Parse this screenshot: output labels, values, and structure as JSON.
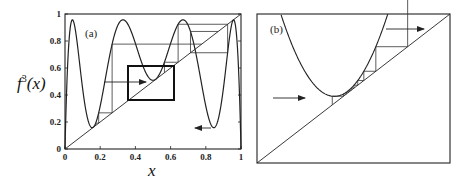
{
  "chart_data": [
    {
      "type": "line",
      "panel_label": "(a)",
      "xlabel": "x",
      "ylabel": "f^3(x)",
      "xlim": [
        0,
        1
      ],
      "ylim": [
        0,
        1
      ],
      "xticks": [
        "0",
        "0.2",
        "0.4",
        "0.6",
        "0.8",
        "1"
      ],
      "yticks": [
        "0",
        "0.2",
        "0.4",
        "0.6",
        "0.8",
        "1"
      ],
      "series": [
        {
          "name": "f^3(x) logistic map, r≈3.83",
          "description": "third iterate of logistic map with four humps, minima near 0.16 and 0.52 and 0.16"
        },
        {
          "name": "diagonal y=x",
          "x": [
            0,
            1
          ],
          "y": [
            0,
            1
          ]
        },
        {
          "name": "cobweb iteration",
          "description": "staircase paths between curve and diagonal"
        }
      ],
      "annotations": [
        {
          "type": "rectangle",
          "x": [
            0.36,
            0.62
          ],
          "y": [
            0.37,
            0.62
          ],
          "note": "zoom region shown in (b)"
        },
        {
          "type": "arrow",
          "from": [
            0.22,
            0.51
          ],
          "to": [
            0.45,
            0.51
          ],
          "direction": "right"
        },
        {
          "type": "arrow",
          "from": [
            0.84,
            0.16
          ],
          "to": [
            0.75,
            0.16
          ],
          "direction": "left"
        }
      ],
      "grid": false
    },
    {
      "type": "line",
      "panel_label": "(b)",
      "xlabel": "",
      "ylabel": "",
      "series": [
        {
          "name": "f^3(x) zoomed near tangency",
          "description": "parabola-like minimum just above the diagonal"
        },
        {
          "name": "diagonal y=x"
        },
        {
          "name": "cobweb iteration",
          "description": "laminar channel: many small steps through narrow gap, then escape"
        }
      ],
      "annotations": [
        {
          "type": "arrow",
          "direction": "right",
          "note": "entry arrow on left"
        },
        {
          "type": "arrow",
          "direction": "right",
          "note": "exit arrow on upper right"
        }
      ],
      "grid": false
    }
  ],
  "panel_a": {
    "label": "(a)",
    "xlabel": "x",
    "ylabel_base": "f",
    "ylabel_sup": "3",
    "ylabel_arg": "(x)",
    "xticks": [
      "0",
      "0.2",
      "0.4",
      "0.6",
      "0.8",
      "1"
    ],
    "yticks": [
      "0",
      "0.2",
      "0.4",
      "0.6",
      "0.8",
      "1"
    ]
  },
  "panel_b": {
    "label": "(b)"
  }
}
